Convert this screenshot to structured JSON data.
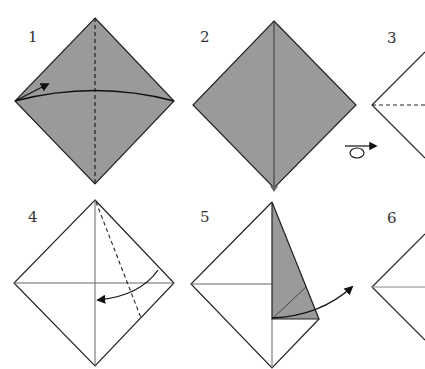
{
  "colors": {
    "paper_colored": "#9a9a9a",
    "paper_white": "#ffffff",
    "line": "#222222",
    "crease": "#777777"
  },
  "steps": [
    {
      "number": "1",
      "description": "Gray square as diamond, dashed vertical valley fold, arrow folding left corner to right"
    },
    {
      "number": "2",
      "description": "Gray square with vertical crease line"
    },
    {
      "number": "3",
      "description": "Turned over, white side, horizontal dashed fold (partially visible)"
    },
    {
      "number": "4",
      "description": "White square with crease cross, dashed fold line from top, arrow folding right edge to center"
    },
    {
      "number": "5",
      "description": "Gray flap folded to center, arrow pointing out"
    },
    {
      "number": "6",
      "description": "White square with horizontal crease (partially visible)"
    }
  ],
  "symbols": {
    "turn_over": "turn-over-icon"
  }
}
